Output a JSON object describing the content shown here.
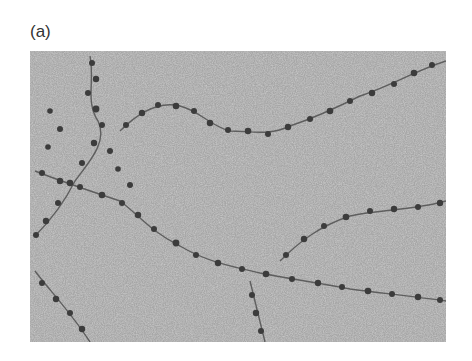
{
  "figure": {
    "panel_label": "(a)",
    "image": {
      "description": "Electron micrograph showing beaded chromatin-like fibers (beads-on-a-string) on a grainy gray background",
      "background_color": "#a9a9a9",
      "strand_color": "#3a3a3a"
    }
  }
}
